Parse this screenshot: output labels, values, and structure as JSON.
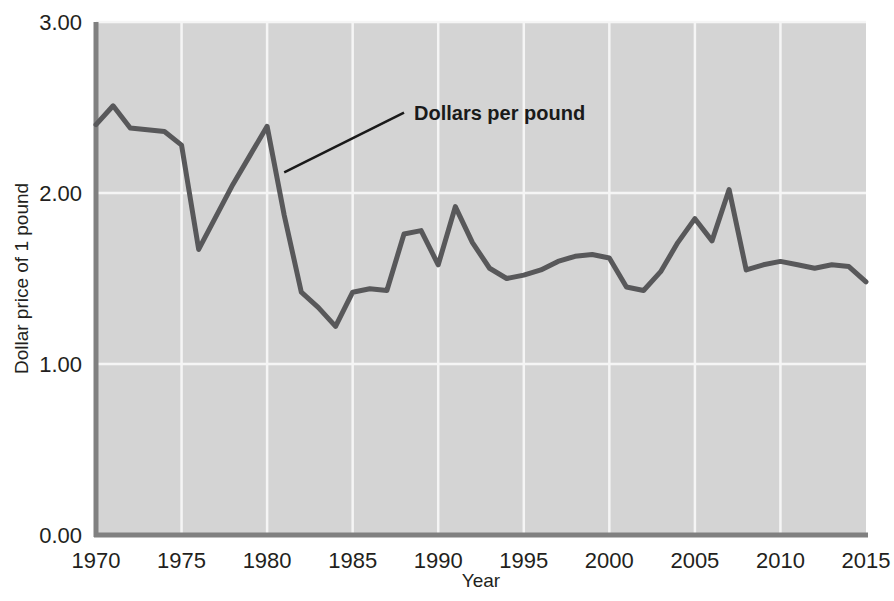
{
  "chart_data": {
    "type": "line",
    "title": "",
    "xlabel": "Year",
    "ylabel": "Dollar price of 1 pound",
    "xlim": [
      1970,
      2015
    ],
    "ylim": [
      0.0,
      3.0
    ],
    "xticks": [
      1970,
      1975,
      1980,
      1985,
      1990,
      1995,
      2000,
      2005,
      2010,
      2015
    ],
    "xtick_labels": [
      "1970",
      "1975",
      "1980",
      "1985",
      "1990",
      "1995",
      "2000",
      "2005",
      "2010",
      "2015"
    ],
    "yticks": [
      0.0,
      1.0,
      2.0,
      3.0
    ],
    "ytick_labels": [
      "0.00",
      "1.00",
      "2.00",
      "3.00"
    ],
    "grid": "both",
    "legend_position": "inline-annotation",
    "series": [
      {
        "name": "Dollars per pound",
        "color": "#58585a",
        "line_width": 5,
        "x": [
          1970,
          1971,
          1972,
          1973,
          1974,
          1975,
          1976,
          1977,
          1978,
          1979,
          1980,
          1981,
          1982,
          1983,
          1984,
          1985,
          1986,
          1987,
          1988,
          1989,
          1990,
          1991,
          1992,
          1993,
          1994,
          1995,
          1996,
          1997,
          1998,
          1999,
          2000,
          2001,
          2002,
          2003,
          2004,
          2005,
          2006,
          2007,
          2008,
          2009,
          2010,
          2011,
          2012,
          2013,
          2014,
          2015
        ],
        "y": [
          2.4,
          2.51,
          2.38,
          2.37,
          2.36,
          2.28,
          1.67,
          1.86,
          2.05,
          2.22,
          2.39,
          1.87,
          1.42,
          1.33,
          1.22,
          1.42,
          1.44,
          1.43,
          1.76,
          1.78,
          1.58,
          1.92,
          1.71,
          1.56,
          1.5,
          1.52,
          1.55,
          1.6,
          1.63,
          1.64,
          1.62,
          1.45,
          1.43,
          1.54,
          1.71,
          1.85,
          1.72,
          2.02,
          1.55,
          1.58,
          1.6,
          1.58,
          1.56,
          1.58,
          1.57,
          1.48
        ]
      }
    ],
    "annotations": [
      {
        "text": "Dollars per pound",
        "data_x": 1981.0,
        "data_y": 2.12,
        "label_x": 1988.0,
        "label_y": 2.47
      }
    ],
    "style": {
      "plot_background": "#d4d4d4",
      "gridline_color": "#f5f5f5",
      "axis_color": "#808080",
      "text_color": "#231f20"
    }
  }
}
